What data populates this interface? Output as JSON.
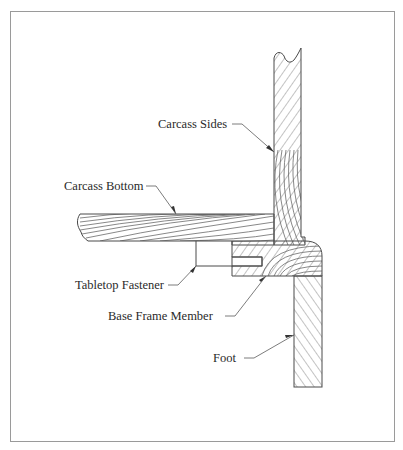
{
  "diagram": {
    "labels": {
      "carcass_sides": "Carcass Sides",
      "carcass_bottom": "Carcass Bottom",
      "tabletop_fastener": "Tabletop Fastener",
      "base_frame_member": "Base Frame Member",
      "foot": "Foot"
    },
    "colors": {
      "outline": "#4a4a4a",
      "grain": "#6a6a6a",
      "border": "#9a9a9a",
      "text": "#2a2a2a"
    }
  }
}
